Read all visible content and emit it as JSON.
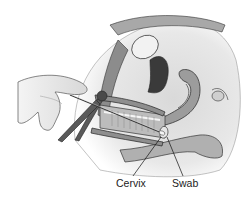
{
  "figure": {
    "style": "grayscale line illustration",
    "labels": {
      "cervix": "Cervix",
      "swab": "Swab"
    },
    "colors": {
      "background": "#ffffff",
      "tissue_light": "#e6e6e6",
      "tissue_mid": "#b8b8b8",
      "tissue_dark": "#6e6e6e",
      "outline": "#2a2a2a",
      "label_text": "#222222"
    }
  }
}
